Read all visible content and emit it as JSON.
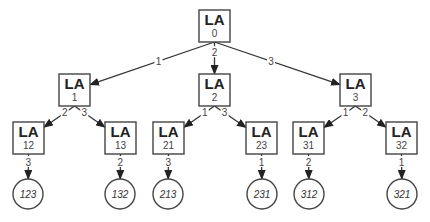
{
  "diagram": {
    "type": "tree",
    "node_title": "LA",
    "nodes": [
      {
        "id": "0",
        "title": "LA",
        "label": "0",
        "kind": "box",
        "x": 199,
        "y": 10,
        "w": 31,
        "h": 32
      },
      {
        "id": "1",
        "title": "LA",
        "label": "1",
        "kind": "box",
        "x": 59,
        "y": 74,
        "w": 31,
        "h": 32
      },
      {
        "id": "2",
        "title": "LA",
        "label": "2",
        "kind": "box",
        "x": 199,
        "y": 74,
        "w": 31,
        "h": 32
      },
      {
        "id": "3",
        "title": "LA",
        "label": "3",
        "kind": "box",
        "x": 340,
        "y": 74,
        "w": 31,
        "h": 32
      },
      {
        "id": "12",
        "title": "LA",
        "label": "12",
        "kind": "box",
        "x": 13,
        "y": 122,
        "w": 31,
        "h": 32
      },
      {
        "id": "13",
        "title": "LA",
        "label": "13",
        "kind": "box",
        "x": 105,
        "y": 122,
        "w": 31,
        "h": 32
      },
      {
        "id": "21",
        "title": "LA",
        "label": "21",
        "kind": "box",
        "x": 153,
        "y": 122,
        "w": 31,
        "h": 32
      },
      {
        "id": "23",
        "title": "LA",
        "label": "23",
        "kind": "box",
        "x": 246,
        "y": 122,
        "w": 31,
        "h": 32
      },
      {
        "id": "31",
        "title": "LA",
        "label": "31",
        "kind": "box",
        "x": 293,
        "y": 122,
        "w": 31,
        "h": 32
      },
      {
        "id": "32",
        "title": "LA",
        "label": "32",
        "kind": "box",
        "x": 386,
        "y": 122,
        "w": 31,
        "h": 32
      },
      {
        "id": "123",
        "label": "123",
        "kind": "leaf",
        "cx": 28,
        "cy": 194,
        "r": 15
      },
      {
        "id": "132",
        "label": "132",
        "kind": "leaf",
        "cx": 120,
        "cy": 194,
        "r": 15
      },
      {
        "id": "213",
        "label": "213",
        "kind": "leaf",
        "cx": 168,
        "cy": 194,
        "r": 15
      },
      {
        "id": "231",
        "label": "231",
        "kind": "leaf",
        "cx": 262,
        "cy": 194,
        "r": 15
      },
      {
        "id": "312",
        "label": "312",
        "kind": "leaf",
        "cx": 309,
        "cy": 194,
        "r": 15
      },
      {
        "id": "321",
        "label": "321",
        "kind": "leaf",
        "cx": 402,
        "cy": 194,
        "r": 15
      }
    ],
    "edges": [
      {
        "from": "0",
        "to": "1",
        "label": "1"
      },
      {
        "from": "0",
        "to": "2",
        "label": "2"
      },
      {
        "from": "0",
        "to": "3",
        "label": "3"
      },
      {
        "from": "1",
        "to": "12",
        "label": "2"
      },
      {
        "from": "1",
        "to": "13",
        "label": "3"
      },
      {
        "from": "2",
        "to": "21",
        "label": "1"
      },
      {
        "from": "2",
        "to": "23",
        "label": "3"
      },
      {
        "from": "3",
        "to": "31",
        "label": "1"
      },
      {
        "from": "3",
        "to": "32",
        "label": "2"
      },
      {
        "from": "12",
        "to": "123",
        "label": "3"
      },
      {
        "from": "13",
        "to": "132",
        "label": "2"
      },
      {
        "from": "21",
        "to": "213",
        "label": "3"
      },
      {
        "from": "23",
        "to": "231",
        "label": "1"
      },
      {
        "from": "31",
        "to": "312",
        "label": "2"
      },
      {
        "from": "32",
        "to": "321",
        "label": "1"
      }
    ]
  }
}
